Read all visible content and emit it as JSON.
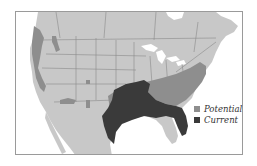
{
  "map": {
    "type": "species range map",
    "region": "North America (United States, southern Canada, northern Mexico)",
    "colors": {
      "land": "#c8c8c8",
      "water": "#ffffff",
      "borders": "#8a8a8a",
      "potential": "#8e8e8e",
      "current": "#3a3a3a"
    }
  },
  "legend": {
    "items": [
      {
        "label": "Potential",
        "color": "#8e8e8e"
      },
      {
        "label": "Current",
        "color": "#3a3a3a"
      }
    ]
  }
}
